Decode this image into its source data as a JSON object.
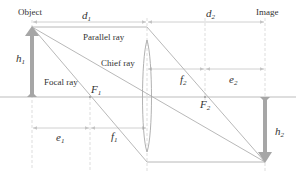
{
  "diagram": {
    "colors": {
      "axis": "#b5b5b5",
      "ray": "#b0b0b0",
      "dim": "#c4c4c4",
      "arrow": "#a6a6a6",
      "text": "#333333"
    },
    "labels": {
      "object": "Object",
      "image": "Image",
      "parallel_ray": "Parallel ray",
      "chief_ray": "Chief ray",
      "focal_ray": "Focal ray",
      "d1": {
        "base": "d",
        "sub": "1"
      },
      "d2": {
        "base": "d",
        "sub": "2"
      },
      "h1": {
        "base": "h",
        "sub": "1"
      },
      "h2": {
        "base": "h",
        "sub": "2"
      },
      "f1": {
        "base": "f",
        "sub": "1"
      },
      "f2": {
        "base": "f",
        "sub": "2"
      },
      "e1": {
        "base": "e",
        "sub": "1"
      },
      "e2": {
        "base": "e",
        "sub": "2"
      },
      "F1": {
        "base": "F",
        "sub": "1"
      },
      "F2": {
        "base": "F",
        "sub": "2"
      }
    },
    "geometry": {
      "axis_y": 97,
      "object_x": 32,
      "object_top_y": 27,
      "lens_x": 147,
      "F1_x": 90,
      "F2_x": 205,
      "image_x": 265,
      "image_bottom_y": 162
    }
  }
}
